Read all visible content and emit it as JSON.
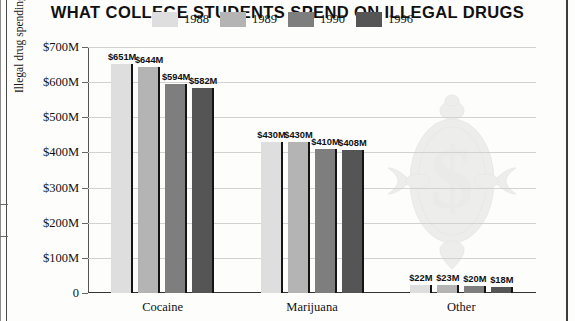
{
  "chart_data": {
    "type": "bar",
    "title": "WHAT COLLEGE STUDENTS SPEND ON ILLEGAL DRUGS",
    "xlabel": "",
    "ylabel": "Illegal drug spending in millions",
    "categories": [
      "Cocaine",
      "Marijuana",
      "Other"
    ],
    "series": [
      {
        "name": "1988",
        "color": "#dedede",
        "values": [
          651,
          644,
          22
        ],
        "labels": [
          "$651M",
          "$430M",
          "$22M"
        ]
      },
      {
        "name": "1989",
        "color": "#b4b4b4",
        "values": [
          644,
          430,
          23
        ],
        "labels": [
          "$644M",
          "$430M",
          "$23M"
        ]
      },
      {
        "name": "1990",
        "color": "#7e7e7e",
        "values": [
          594,
          410,
          20
        ],
        "labels": [
          "$594M",
          "$410M",
          "$20M"
        ]
      },
      {
        "name": "1996",
        "color": "#555555",
        "values": [
          582,
          408,
          18
        ],
        "labels": [
          "$582M",
          "$408M",
          "$18M"
        ]
      }
    ],
    "groups": [
      {
        "category": "Cocaine",
        "bars": [
          {
            "series": "1988",
            "value": 651,
            "label": "$651M"
          },
          {
            "series": "1989",
            "value": 644,
            "label": "$644M"
          },
          {
            "series": "1990",
            "value": 594,
            "label": "$594M"
          },
          {
            "series": "1996",
            "value": 582,
            "label": "$582M"
          }
        ]
      },
      {
        "category": "Marijuana",
        "bars": [
          {
            "series": "1988",
            "value": 430,
            "label": "$430M"
          },
          {
            "series": "1989",
            "value": 430,
            "label": "$430M"
          },
          {
            "series": "1990",
            "value": 410,
            "label": "$410M"
          },
          {
            "series": "1996",
            "value": 408,
            "label": "$408M"
          }
        ]
      },
      {
        "category": "Other",
        "bars": [
          {
            "series": "1988",
            "value": 22,
            "label": "$22M"
          },
          {
            "series": "1989",
            "value": 23,
            "label": "$23M"
          },
          {
            "series": "1990",
            "value": 20,
            "label": "$20M"
          },
          {
            "series": "1996",
            "value": 18,
            "label": "$18M"
          }
        ]
      }
    ],
    "ylim": [
      0,
      700
    ],
    "ytick_values": [
      700,
      600,
      500,
      400,
      300,
      200,
      100,
      0
    ],
    "ytick_labels": [
      "$700M",
      "$600M",
      "$500M",
      "$400M",
      "$300M",
      "$200M",
      "$100M",
      "0"
    ],
    "grid": true,
    "legend_position": "top-center",
    "units": "millions of USD"
  },
  "legend": {
    "items": [
      {
        "label": "1988",
        "color": "#dedede"
      },
      {
        "label": "1989",
        "color": "#b4b4b4"
      },
      {
        "label": "1990",
        "color": "#7e7e7e"
      },
      {
        "label": "1996",
        "color": "#555555"
      }
    ]
  },
  "decoration": {
    "watermark_name": "ornamental-dollar-sign",
    "watermark_symbol": "$",
    "watermark_color": "#c9c9c9"
  }
}
